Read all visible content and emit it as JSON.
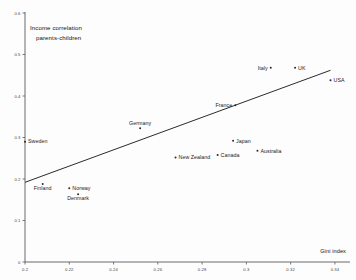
{
  "chart_data": {
    "type": "scatter",
    "title": "",
    "xlabel": "Gini index",
    "ylabel": "Income correlation parents-children",
    "ylabel_line1": "Income correlation",
    "ylabel_line2": "parents-children",
    "xlim": [
      0.2,
      0.345
    ],
    "ylim": [
      0.0,
      0.6
    ],
    "xticks": [
      "0.2",
      "0.22",
      "0.24",
      "0.26",
      "0.28",
      "0.3",
      "0.32",
      "0.34"
    ],
    "xtick_values": [
      0.2,
      0.22,
      0.24,
      0.26,
      0.28,
      0.3,
      0.32,
      0.34
    ],
    "yticks": [
      "0",
      "0.1",
      "0.2",
      "0.3",
      "0.4",
      "0.5",
      "0.6"
    ],
    "ytick_values": [
      0,
      0.1,
      0.2,
      0.3,
      0.4,
      0.5,
      0.6
    ],
    "grid": false,
    "legend": "none",
    "marker_color": "#2b2b2b",
    "line_color": "#2b2b2b",
    "axis_color": "#5a5a5a",
    "points": [
      {
        "label": "Sweden",
        "x": 0.2,
        "y": 0.29,
        "label_side": "right"
      },
      {
        "label": "Finland",
        "x": 0.208,
        "y": 0.188,
        "label_side": "below"
      },
      {
        "label": "Norway",
        "x": 0.22,
        "y": 0.178,
        "label_side": "right"
      },
      {
        "label": "Denmark",
        "x": 0.224,
        "y": 0.163,
        "label_side": "below"
      },
      {
        "label": "Germany",
        "x": 0.252,
        "y": 0.322,
        "label_side": "above"
      },
      {
        "label": "New Zealand",
        "x": 0.268,
        "y": 0.252,
        "label_side": "right"
      },
      {
        "label": "Canada",
        "x": 0.287,
        "y": 0.258,
        "label_side": "right"
      },
      {
        "label": "France",
        "x": 0.295,
        "y": 0.378,
        "label_side": "left"
      },
      {
        "label": "Japan",
        "x": 0.294,
        "y": 0.292,
        "label_side": "right"
      },
      {
        "label": "Australia",
        "x": 0.305,
        "y": 0.268,
        "label_side": "right"
      },
      {
        "label": "Italy",
        "x": 0.311,
        "y": 0.468,
        "label_side": "left"
      },
      {
        "label": "UK",
        "x": 0.322,
        "y": 0.468,
        "label_side": "right"
      },
      {
        "label": "USA",
        "x": 0.338,
        "y": 0.438,
        "label_side": "right"
      }
    ],
    "trend_line": {
      "x_start": 0.2,
      "y_start": 0.192,
      "x_end": 0.338,
      "y_end": 0.462
    }
  }
}
